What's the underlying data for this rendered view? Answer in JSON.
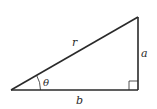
{
  "diagram": {
    "type": "right-triangle",
    "labels": {
      "hypotenuse": "r",
      "opposite": "a",
      "adjacent": "b",
      "angle": "θ"
    },
    "colors": {
      "stroke": "#2a2a2a",
      "background": "#ffffff"
    }
  }
}
